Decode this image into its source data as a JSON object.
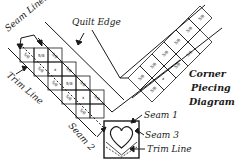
{
  "diagram": {
    "title_lines": [
      "Corner",
      "Piecing",
      "Diagram"
    ],
    "labels": {
      "seam_lines": "Seam Lines",
      "quilt_edge": "Quilt Edge",
      "trim_line_left": "Trim Line",
      "seam_1": "Seam 1",
      "seam_2": "Seam 2",
      "seam_3": "Seam 3",
      "trim_line_block": "Trim Line"
    },
    "cell_marks": {
      "seam_allowance": "5/8",
      "square_mark": "5/8",
      "center_mark": "x"
    },
    "colors": {
      "ink": "#1a1a1a",
      "background": "#ffffff"
    }
  }
}
